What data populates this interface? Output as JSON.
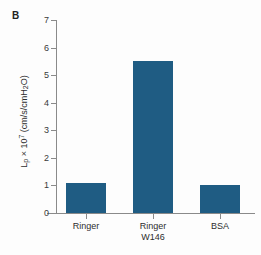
{
  "panel": {
    "letter": "B"
  },
  "chart_data": {
    "type": "bar",
    "title": "",
    "subtitle": "",
    "xlabel": "",
    "ylabel": "Lp × 10^7 (cm/s/cmH2O)",
    "ylabel_parts": {
      "symbol": "L",
      "symbol_sub": "p",
      "times": " × 10",
      "exponent": "7",
      "units": " (cm/s/cmH",
      "units_sub": "2",
      "units_end": "O)"
    },
    "categories": [
      "Ringer",
      "Ringer\nW146",
      "BSA"
    ],
    "category_labels_flat": [
      "Ringer",
      "Ringer W146",
      "BSA"
    ],
    "values": [
      1.1,
      5.5,
      1.0
    ],
    "ylim": [
      0,
      7
    ],
    "yticks": [
      0,
      1,
      2,
      3,
      4,
      5,
      6,
      7
    ],
    "ytick_labels": [
      "0",
      "1",
      "2",
      "3",
      "4",
      "5",
      "6",
      "7"
    ],
    "grid": false,
    "legend": false,
    "legend_position": "none",
    "bar_color": "#1f5c83",
    "axis_color": "#8a8a8a",
    "background_color": "#fdfdfd"
  }
}
